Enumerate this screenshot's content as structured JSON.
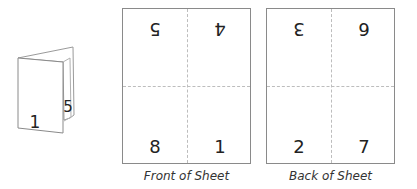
{
  "booklet": {
    "front_page_number": "1",
    "inner_page_number": "5"
  },
  "sheets": [
    {
      "caption": "Front of Sheet",
      "top_left": "5",
      "top_right": "4",
      "bottom_left": "8",
      "bottom_right": "1",
      "top_row_upside_down": true
    },
    {
      "caption": "Back of Sheet",
      "top_left": "3",
      "top_right": "6",
      "bottom_left": "2",
      "bottom_right": "7",
      "top_row_upside_down": true
    }
  ],
  "colors": {
    "border": "#8a8a8a",
    "fold_line": "#bdbdbd",
    "text": "#222222"
  }
}
